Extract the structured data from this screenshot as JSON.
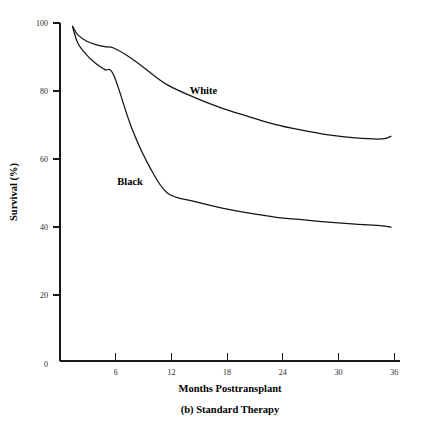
{
  "chart_data": {
    "type": "line",
    "title": "",
    "caption": "(b) Standard Therapy",
    "xlabel": "Months Posttransplant",
    "ylabel": "Survival (%)",
    "xlim": [
      0,
      38
    ],
    "ylim": [
      0,
      100
    ],
    "xticks": [
      6,
      12,
      18,
      24,
      30,
      36
    ],
    "xtick_labels": [
      "6",
      "12",
      "18",
      "24",
      "30",
      "36"
    ],
    "yticks": [
      0,
      20,
      40,
      60,
      80,
      100
    ],
    "ytick_labels": [
      "0",
      "20",
      "40",
      "60",
      "80",
      "100"
    ],
    "grid": false,
    "legend_position": "inline-annotation",
    "series": [
      {
        "name": "White",
        "label": "White",
        "label_x": 14.5,
        "label_y": 79,
        "color": "#141414",
        "x": [
          1.4,
          2,
          3,
          4,
          5,
          6,
          8,
          10,
          12,
          15,
          18,
          21,
          24,
          27,
          30,
          33,
          36,
          37
        ],
        "values": [
          99,
          96.5,
          94.6,
          93.6,
          93,
          92.6,
          89.5,
          85.5,
          81.7,
          78,
          74.9,
          72.4,
          70,
          68.3,
          66.9,
          66,
          65.7,
          66.5
        ]
      },
      {
        "name": "Black",
        "label": "Black",
        "label_x": 6.4,
        "label_y": 52,
        "color": "#141414",
        "x": [
          1.4,
          2,
          3,
          4,
          5,
          6,
          8,
          10,
          12,
          15,
          18,
          21,
          24,
          27,
          30,
          33,
          36,
          37
        ],
        "values": [
          99,
          94,
          90.5,
          88,
          86.2,
          84.6,
          69,
          57.5,
          49.7,
          47.2,
          45.3,
          43.8,
          42.6,
          41.8,
          41.1,
          40.5,
          40,
          39.6
        ]
      }
    ]
  }
}
